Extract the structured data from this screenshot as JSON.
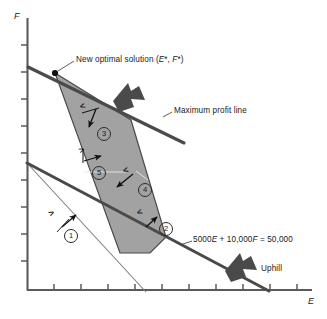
{
  "figure": {
    "width": 327,
    "height": 319
  },
  "axes": {
    "x_label": "E",
    "y_label": "F",
    "x_tick_count": 10,
    "y_tick_count": 10,
    "axis_color": "#5a5a5a"
  },
  "annotations": {
    "optimal_solution": "New optimal solution (E*, F*)",
    "optimal_solution_parts": {
      "prefix": "New optimal solution (",
      "var1": "E",
      "star1": "*",
      "sep": ", ",
      "var2": "F",
      "star2": "*",
      "suffix": ")"
    },
    "max_profit_line": "Maximum profit line",
    "constraint_equation": "5000E + 10,000F = 50,000",
    "constraint_equation_parts": {
      "p1": "5000",
      "v1": "E",
      "p2": " + 10,000",
      "v2": "F",
      "p3": " = 50,000"
    },
    "uphill": "Uphill"
  },
  "constraints": [
    {
      "id": "1",
      "number": "①",
      "label": "1",
      "sign": ">",
      "x": 64,
      "y": 229,
      "sign_x": 49,
      "sign_y": 212
    },
    {
      "id": "2",
      "number": "②",
      "label": "2",
      "sign": "<",
      "x": 159,
      "y": 226,
      "sign_x": 141,
      "sign_y": 213
    },
    {
      "id": "3",
      "number": "③",
      "label": "3",
      "sign": "<",
      "x": 97,
      "y": 127,
      "sign_x": 83,
      "sign_y": 108
    },
    {
      "id": "4",
      "number": "④",
      "label": "4",
      "sign": "<",
      "x": 138,
      "y": 183,
      "sign_x": 124,
      "sign_y": 168
    },
    {
      "id": "5",
      "number": "⑤",
      "label": "5",
      "sign": ">",
      "x": 95,
      "y": 173,
      "sign_x": 85,
      "sign_y": 152
    }
  ],
  "colors": {
    "feasible_region_fill": "#9d9d9d",
    "feasible_region_stroke": "#4a4a4a",
    "thick_line": "#4a4a4a",
    "thin_line": "#6e6e6e",
    "arrow_block": "#4a4a4a",
    "text": "#1a1a1a",
    "background": "#ffffff"
  },
  "geometry": {
    "y_axis_x": 27,
    "x_axis_y": 290,
    "optimal_point": {
      "x": 55,
      "y": 73
    },
    "feasible_region_vertices": [
      {
        "x": 55,
        "y": 73
      },
      {
        "x": 131,
        "y": 120
      },
      {
        "x": 166,
        "y": 237
      },
      {
        "x": 150,
        "y": 253
      },
      {
        "x": 120,
        "y": 253
      }
    ],
    "profit_line": {
      "x1": 28,
      "y1": 67,
      "x2": 184,
      "y2": 143
    },
    "budget_line": {
      "x1": 27,
      "y1": 163,
      "x2": 269,
      "y2": 291
    },
    "thin_constraint_line": {
      "x1": 27,
      "y1": 163,
      "x2": 146,
      "y2": 292
    }
  }
}
